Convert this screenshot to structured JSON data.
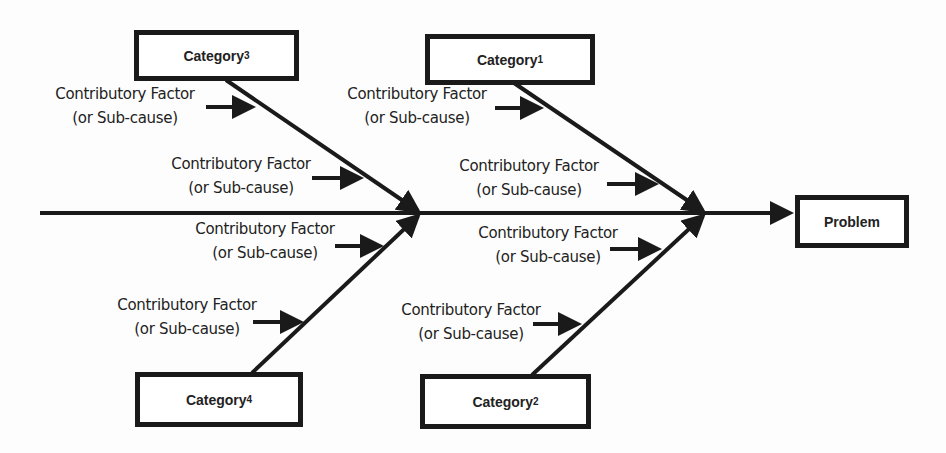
{
  "diagram": {
    "type": "fishbone (Ishikawa) cause-and-effect diagram",
    "problem": {
      "label": "Problem"
    },
    "categories": [
      {
        "id": "cat1",
        "base": "Category",
        "sub": "1"
      },
      {
        "id": "cat2",
        "base": "Category",
        "sub": "2"
      },
      {
        "id": "cat3",
        "base": "Category",
        "sub": "3"
      },
      {
        "id": "cat4",
        "base": "Category",
        "sub": "4"
      }
    ],
    "factors": [
      {
        "category": "cat3",
        "line1": "Contributory Factor",
        "line2": "(or Sub-cause)"
      },
      {
        "category": "cat3",
        "line1": "Contributory Factor",
        "line2": "(or Sub-cause)"
      },
      {
        "category": "cat1",
        "line1": "Contributory Factor",
        "line2": "(or Sub-cause)"
      },
      {
        "category": "cat1",
        "line1": "Contributory Factor",
        "line2": "(or Sub-cause)"
      },
      {
        "category": "cat4",
        "line1": "Contributory Factor",
        "line2": "(or Sub-cause)"
      },
      {
        "category": "cat4",
        "line1": "Contributory Factor",
        "line2": "(or Sub-cause)"
      },
      {
        "category": "cat2",
        "line1": "Contributory Factor",
        "line2": "(or Sub-cause)"
      },
      {
        "category": "cat2",
        "line1": "Contributory Factor",
        "line2": "(or Sub-cause)"
      }
    ],
    "colors": {
      "stroke": "#1a1a1a",
      "text": "#222222",
      "background": "#fdfdfd"
    }
  }
}
